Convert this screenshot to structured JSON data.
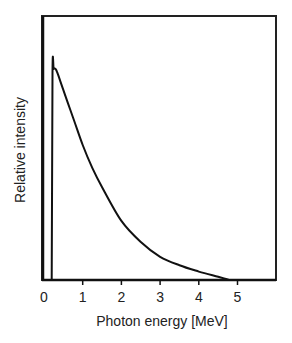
{
  "chart_data": {
    "type": "line",
    "title": "",
    "xlabel": "Photon energy [MeV]",
    "ylabel": "Relative intensity",
    "xlim": [
      0,
      6
    ],
    "ylim": [
      0,
      1.0
    ],
    "x_ticks": [
      "0",
      "1",
      "2",
      "3",
      "4",
      "5"
    ],
    "y_ticks": [],
    "grid": false,
    "legend": null,
    "series": [
      {
        "name": "photon spectrum",
        "x": [
          0.2,
          0.22,
          0.25,
          0.3,
          0.35,
          0.5,
          0.75,
          1.0,
          1.25,
          1.5,
          2.0,
          2.5,
          3.0,
          3.5,
          4.0,
          4.5,
          4.8
        ],
        "y": [
          0.0,
          0.98,
          1.0,
          1.0,
          0.98,
          0.9,
          0.77,
          0.64,
          0.53,
          0.44,
          0.28,
          0.18,
          0.11,
          0.07,
          0.04,
          0.015,
          0.0
        ]
      }
    ]
  },
  "labels": {
    "xlabel": "Photon energy [MeV]",
    "ylabel": "Relative intensity",
    "ticks": [
      "0",
      "1",
      "2",
      "3",
      "4",
      "5"
    ]
  }
}
